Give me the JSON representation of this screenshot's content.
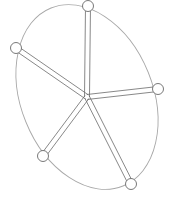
{
  "diagram": {
    "type": "wheel-with-spokes",
    "colors": {
      "background": "#ffffff",
      "rim": "#a8a8a8",
      "spoke": "#6a6a6a",
      "node": "#6a6a6a",
      "node_fill": "#ffffff"
    },
    "rim": {
      "cx": 87,
      "cy": 97,
      "rx": 66,
      "ry": 96,
      "rotation": -22
    },
    "hub": {
      "x": 87,
      "y": 97
    },
    "spoke_width": 5,
    "node_radius": 5.5,
    "nodes": [
      {
        "name": "node-top",
        "x": 88,
        "y": 6
      },
      {
        "name": "node-left",
        "x": 16,
        "y": 48
      },
      {
        "name": "node-right",
        "x": 158,
        "y": 89
      },
      {
        "name": "node-bottom-left",
        "x": 43,
        "y": 156
      },
      {
        "name": "node-bottom-right",
        "x": 131,
        "y": 184
      }
    ]
  }
}
